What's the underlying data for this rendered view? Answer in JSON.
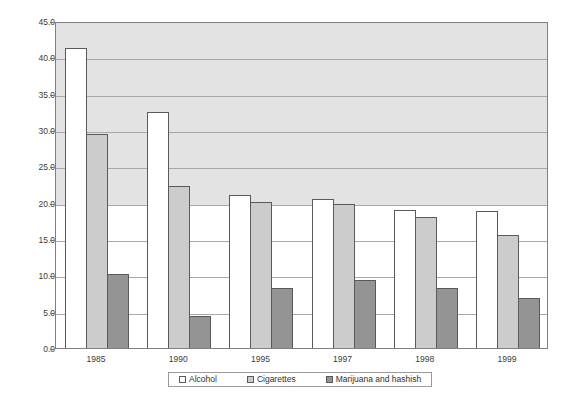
{
  "chart_data": {
    "type": "bar",
    "title": "",
    "xlabel": "",
    "ylabel": "",
    "categories": [
      "1985",
      "1990",
      "1995",
      "1997",
      "1998",
      "1999"
    ],
    "series": [
      {
        "name": "Alcohol",
        "color": "#ffffff",
        "values": [
          41.3,
          32.5,
          21.0,
          20.5,
          19.0,
          18.9
        ]
      },
      {
        "name": "Cigarettes",
        "color": "#cccccc",
        "values": [
          29.4,
          22.3,
          20.1,
          19.8,
          18.0,
          15.6
        ]
      },
      {
        "name": "Marijuana and hashish",
        "color": "#949494",
        "values": [
          10.2,
          4.4,
          8.2,
          9.4,
          8.2,
          6.9
        ]
      }
    ],
    "ylim": [
      0.0,
      45.0
    ],
    "ytick_values": [
      0.0,
      5.0,
      10.0,
      15.0,
      20.0,
      25.0,
      30.0,
      35.0,
      40.0,
      45.0
    ],
    "ytick_labels": [
      "0.0",
      "5.0",
      "10.0",
      "15.0",
      "20.0",
      "25.0",
      "30.0",
      "35.0",
      "40.0",
      "45.0"
    ],
    "grid": true,
    "legend_position": "bottom",
    "plot_background_upper": "#e3e3e3",
    "plot_background_lower": "#ffffff",
    "shaded_band_above": 20.0
  }
}
